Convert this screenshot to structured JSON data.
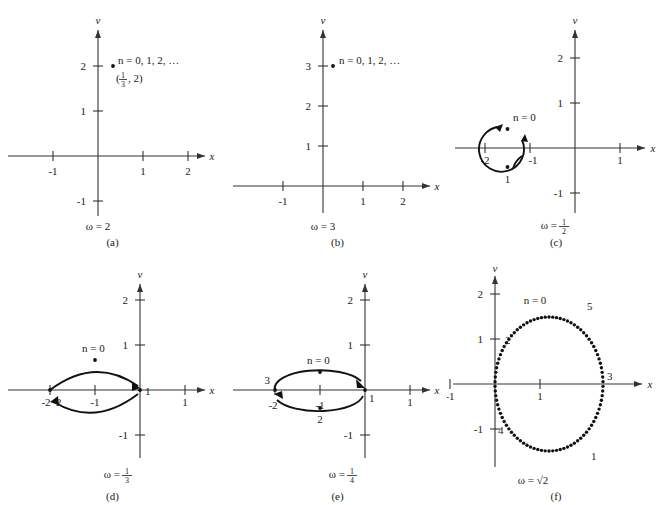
{
  "figure": {
    "axis_labels": {
      "x": "x",
      "v": "v"
    },
    "panels": [
      {
        "id": "a",
        "caption": "(a)",
        "omega": "ω = 2",
        "omega_value": "2",
        "annotation": "n = 0, 1, 2, …",
        "coordinate_label_open": "(",
        "coordinate_numerator": "1",
        "coordinate_denominator": "3",
        "coordinate_label_close": ", 2)",
        "xticks": [
          "-1",
          "1",
          "2"
        ],
        "vticks": [
          "2",
          "1",
          "-1"
        ],
        "points": [
          {
            "label": "",
            "x": 0.333,
            "v": 2
          }
        ]
      },
      {
        "id": "b",
        "caption": "(b)",
        "omega": "ω = 3",
        "omega_value": "3",
        "annotation": "n = 0, 1, 2, …",
        "xticks": [
          "-1",
          "1",
          "2"
        ],
        "vticks": [
          "3",
          "2",
          "1"
        ],
        "points": [
          {
            "label": "",
            "x": 0.2,
            "v": 3
          }
        ]
      },
      {
        "id": "c",
        "caption": "(c)",
        "omega_prefix": "ω = ",
        "omega_numerator": "1",
        "omega_denominator": "2",
        "annotation": "n = 0",
        "xticks": [
          "-2",
          "-1",
          "1"
        ],
        "vticks": [
          "2",
          "1",
          "-1"
        ],
        "curve": "circle",
        "curve_center_x": -1.5,
        "curve_center_v": 0,
        "curve_radius": 0.5,
        "points": [
          {
            "label": "n = 0",
            "x": -1.5,
            "v": 0.42
          },
          {
            "label": "1",
            "x": -1.5,
            "v": -0.42
          }
        ]
      },
      {
        "id": "d",
        "caption": "(d)",
        "omega_prefix": "ω = ",
        "omega_numerator": "1",
        "omega_denominator": "3",
        "annotation": "n = 0",
        "xticks": [
          "-2",
          "-1",
          "1"
        ],
        "vticks": [
          "2",
          "1",
          "-1"
        ],
        "curve": "lens",
        "points": [
          {
            "label": "n = 0",
            "x": -1.0,
            "v": 0.33
          },
          {
            "label": "2",
            "x": -2.0,
            "v": 0
          },
          {
            "label": "1",
            "x": 0.0,
            "v": 0
          }
        ]
      },
      {
        "id": "e",
        "caption": "(e)",
        "omega_prefix": "ω = ",
        "omega_numerator": "1",
        "omega_denominator": "4",
        "annotation": "n = 0",
        "xticks": [
          "-2",
          "-1",
          "1"
        ],
        "vticks": [
          "2",
          "1",
          "-1"
        ],
        "curve": "ellipse",
        "curve_center_x": -1.0,
        "curve_center_v": 0,
        "curve_rx": 1.0,
        "curve_rv": 0.4,
        "points": [
          {
            "label": "n = 0",
            "x": -1.0,
            "v": 0.4
          },
          {
            "label": "3",
            "x": -2.0,
            "v": 0
          },
          {
            "label": "1",
            "x": 0.0,
            "v": 0
          },
          {
            "label": "2",
            "x": -1.0,
            "v": -0.4
          }
        ]
      },
      {
        "id": "f",
        "caption": "(f)",
        "omega": "ω = √2",
        "omega_value": "√2",
        "annotation": "n = 0",
        "xticks": [
          "-1",
          "1",
          "3"
        ],
        "vticks": [
          "2",
          "1",
          "-1"
        ],
        "curve": "dotted-ellipse",
        "curve_center_x": 1.2,
        "curve_center_v": 0,
        "curve_rx": 1.2,
        "curve_rv": 1.5,
        "dot_count": 90,
        "points": [
          {
            "label": "n = 0",
            "x": 1.05,
            "v": 1.5
          },
          {
            "label": "5",
            "x": 1.9,
            "v": 1.35
          },
          {
            "label": "2",
            "x": 0.25,
            "v": 0.85
          },
          {
            "label": "3",
            "x": 2.42,
            "v": 0.05
          },
          {
            "label": "4",
            "x": 0.1,
            "v": -0.95
          },
          {
            "label": "1",
            "x": 1.95,
            "v": -1.35
          }
        ]
      }
    ]
  },
  "chart_data": {
    "type": "scatter",
    "title": "",
    "xlabel": "x",
    "ylabel": "v",
    "grid": false,
    "legend": "none",
    "subplots": [
      {
        "id": "a",
        "omega": 2,
        "xlim": [
          -1.6,
          2.6
        ],
        "ylim": [
          -1.6,
          2.7
        ],
        "xticks": [
          -1,
          1,
          2
        ],
        "yticks": [
          -1,
          1,
          2
        ],
        "points": [
          {
            "x": 0.333,
            "y": 2
          }
        ],
        "annotations": [
          "n = 0, 1, 2, …",
          "(1/3, 2)",
          "ω = 2"
        ]
      },
      {
        "id": "b",
        "omega": 3,
        "xlim": [
          -1.6,
          2.6
        ],
        "ylim": [
          -0.6,
          3.6
        ],
        "xticks": [
          -1,
          1,
          2
        ],
        "yticks": [
          1,
          2,
          3
        ],
        "points": [
          {
            "x": 0.2,
            "y": 3
          }
        ],
        "annotations": [
          "n = 0, 1, 2, …",
          "ω = 3"
        ]
      },
      {
        "id": "c",
        "omega": 0.5,
        "xlim": [
          -2.6,
          1.6
        ],
        "ylim": [
          -1.6,
          2.6
        ],
        "xticks": [
          -2,
          -1,
          1
        ],
        "yticks": [
          -1,
          1,
          2
        ],
        "curve": {
          "shape": "circle",
          "cx": -1.5,
          "cy": 0,
          "r": 0.5
        },
        "points": [
          {
            "x": -1.5,
            "y": 0.42,
            "label": "n = 0"
          },
          {
            "x": -1.5,
            "y": -0.42,
            "label": "1"
          }
        ],
        "annotations": [
          "ω = 1/2"
        ]
      },
      {
        "id": "d",
        "omega": 0.3333,
        "xlim": [
          -2.6,
          1.6
        ],
        "ylim": [
          -1.6,
          2.6
        ],
        "xticks": [
          -2,
          -1,
          1
        ],
        "yticks": [
          -1,
          1,
          2
        ],
        "curve": {
          "shape": "lens",
          "x_from": -2,
          "x_to": 0,
          "y_half": 0.33
        },
        "points": [
          {
            "x": -1.0,
            "y": 0.33,
            "label": "n = 0"
          },
          {
            "x": -2.0,
            "y": 0,
            "label": "2"
          },
          {
            "x": 0.0,
            "y": 0,
            "label": "1"
          }
        ],
        "annotations": [
          "ω = 1/3"
        ]
      },
      {
        "id": "e",
        "omega": 0.25,
        "xlim": [
          -2.6,
          1.6
        ],
        "ylim": [
          -1.6,
          2.6
        ],
        "xticks": [
          -2,
          -1,
          1
        ],
        "yticks": [
          -1,
          1,
          2
        ],
        "curve": {
          "shape": "ellipse",
          "cx": -1,
          "cy": 0,
          "rx": 1,
          "ry": 0.4
        },
        "points": [
          {
            "x": -1.0,
            "y": 0.4,
            "label": "n = 0"
          },
          {
            "x": -2.0,
            "y": 0,
            "label": "3"
          },
          {
            "x": 0.0,
            "y": 0,
            "label": "1"
          },
          {
            "x": -1.0,
            "y": -0.4,
            "label": "2"
          }
        ],
        "annotations": [
          "ω = 1/4"
        ]
      },
      {
        "id": "f",
        "omega": 1.41421356,
        "xlim": [
          -1.6,
          3.4
        ],
        "ylim": [
          -2.1,
          2.3
        ],
        "xticks": [
          -1,
          1,
          3
        ],
        "yticks": [
          -1,
          1,
          2
        ],
        "curve": {
          "shape": "ellipse-dotted",
          "cx": 1.2,
          "cy": 0,
          "rx": 1.2,
          "ry": 1.5,
          "dots": 90
        },
        "points": [
          {
            "x": 1.05,
            "y": 1.5,
            "label": "n = 0"
          },
          {
            "x": 1.9,
            "y": 1.35,
            "label": "5"
          },
          {
            "x": 0.25,
            "y": 0.85,
            "label": "2"
          },
          {
            "x": 2.42,
            "y": 0.05,
            "label": "3"
          },
          {
            "x": 0.1,
            "y": -0.95,
            "label": "4"
          },
          {
            "x": 1.95,
            "y": -1.35,
            "label": "1"
          }
        ],
        "annotations": [
          "ω = √2"
        ]
      }
    ]
  }
}
